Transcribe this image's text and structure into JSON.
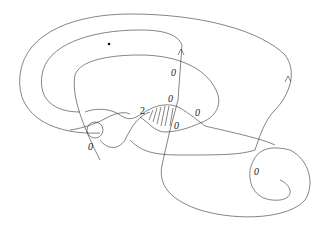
{
  "diagram": {
    "type": "kirby-diagram",
    "labels": [
      {
        "id": "label-upper-vertical",
        "text": "0",
        "x": 171,
        "y": 76
      },
      {
        "id": "label-center-top",
        "text": "0",
        "x": 168,
        "y": 102
      },
      {
        "id": "label-center-right",
        "text": "0",
        "x": 195,
        "y": 116
      },
      {
        "id": "label-center-lower",
        "text": "0",
        "x": 174,
        "y": 129
      },
      {
        "id": "label-two",
        "text": "2",
        "x": 140,
        "y": 114
      },
      {
        "id": "label-circle",
        "text": "0",
        "x": 88,
        "y": 150
      },
      {
        "id": "label-lower-right",
        "text": "0",
        "x": 254,
        "y": 175
      }
    ],
    "dot": {
      "x": 109,
      "y": 44
    },
    "colors": {
      "stroke": "#333333",
      "text": "#222222",
      "background": "#ffffff"
    }
  }
}
